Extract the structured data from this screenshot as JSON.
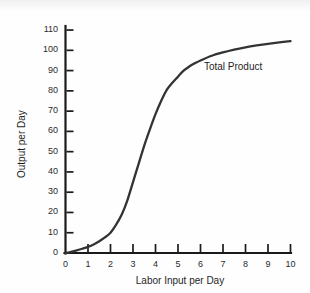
{
  "chart_data": {
    "type": "line",
    "title": "",
    "xlabel": "Labor Input per Day",
    "ylabel": "Output per Day",
    "xlim": [
      0,
      10
    ],
    "ylim": [
      0,
      112
    ],
    "grid": false,
    "legend": "none",
    "xticks": [
      "0",
      "1",
      "2",
      "3",
      "4",
      "5",
      "6",
      "7",
      "8",
      "9",
      "10"
    ],
    "xtick_values": [
      0,
      1,
      2,
      3,
      4,
      5,
      6,
      7,
      8,
      9,
      10
    ],
    "yticks": [
      "0",
      "10",
      "20",
      "30",
      "40",
      "50",
      "60",
      "70",
      "80",
      "90",
      "100",
      "110"
    ],
    "ytick_values": [
      0,
      10,
      20,
      30,
      40,
      50,
      60,
      70,
      80,
      90,
      100,
      110
    ],
    "series": [
      {
        "name": "Total Product",
        "color": "#333333",
        "annotation": "Total Product",
        "annotation_x": 6.15,
        "annotation_y": 92,
        "x": [
          0,
          0.25,
          0.5,
          0.75,
          1,
          1.25,
          1.5,
          1.75,
          2,
          2.25,
          2.5,
          2.75,
          3,
          3.25,
          3.5,
          3.75,
          4,
          4.25,
          4.5,
          4.75,
          5,
          5.25,
          5.5,
          5.75,
          6,
          6.5,
          7,
          7.5,
          8,
          8.5,
          9,
          9.5,
          10
        ],
        "values": [
          0,
          0.6,
          1.3,
          2.1,
          3,
          4.2,
          5.8,
          7.7,
          10,
          14,
          19,
          26,
          35,
          44,
          53,
          61,
          68.5,
          75,
          80.5,
          84,
          87,
          90,
          92,
          93.6,
          95,
          97.3,
          99,
          100.4,
          101.5,
          102.4,
          103.2,
          103.9,
          104.5
        ]
      }
    ]
  },
  "axes": {
    "y_axis_name": "output-axis",
    "x_axis_name": "labor-axis"
  }
}
